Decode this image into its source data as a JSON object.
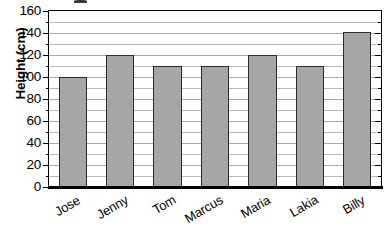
{
  "chart_data": {
    "type": "bar",
    "title": "",
    "xlabel": "",
    "ylabel": "Height (cm)",
    "categories": [
      "Jose",
      "Jenny",
      "Tom",
      "Marcus",
      "Maria",
      "Lakia",
      "Billy"
    ],
    "values": [
      100,
      120,
      110,
      110,
      120,
      110,
      141
    ],
    "ylim": [
      0,
      160
    ],
    "ytick_labels": [
      "0",
      "20",
      "40",
      "60",
      "80",
      "100",
      "120",
      "140",
      "160"
    ],
    "ytick_values": [
      0,
      20,
      40,
      60,
      80,
      100,
      120,
      140,
      160
    ],
    "minor_tick_step": 10,
    "grid": true,
    "grid_axis": "y",
    "legend": false,
    "bar_color": "#a6a6a6",
    "bar_border_color": "#2b2b2b",
    "gridline_color": "#b9b9b9",
    "axis_color": "#000000",
    "background_color": "#ffffff"
  }
}
